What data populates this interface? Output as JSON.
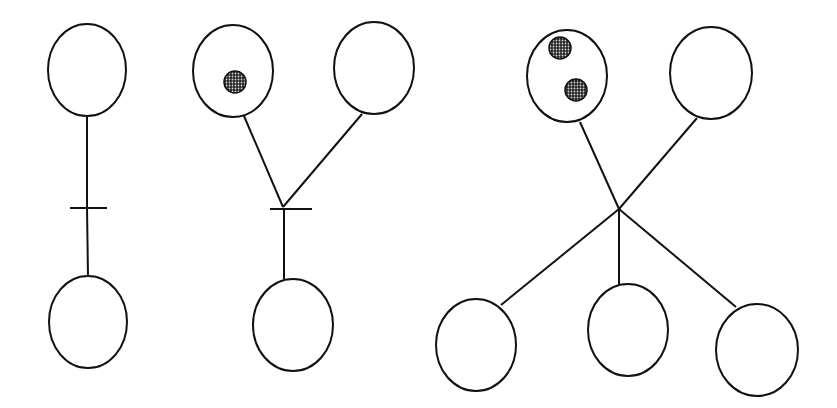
{
  "diagram": {
    "type": "petri-net",
    "colors": {
      "stroke": "#111111",
      "token": "#6e6e6e",
      "background": "#ffffff"
    },
    "nets": [
      {
        "id": "net-1",
        "places": [
          {
            "id": "p1",
            "cx": 87,
            "cy": 70,
            "rx": 39,
            "ry": 46,
            "tokens": []
          },
          {
            "id": "p2",
            "cx": 88,
            "cy": 322,
            "rx": 39,
            "ry": 46,
            "tokens": []
          }
        ],
        "transitions": [
          {
            "id": "t1",
            "x1": 70,
            "x2": 107,
            "y": 208
          }
        ],
        "arcs": [
          [
            87,
            116,
            87,
            208
          ],
          [
            87,
            208,
            88,
            276
          ]
        ]
      },
      {
        "id": "net-2",
        "places": [
          {
            "id": "p1",
            "cx": 233,
            "cy": 71,
            "rx": 40,
            "ry": 46,
            "tokens": [
              {
                "cx": 235,
                "cy": 82,
                "r": 11
              }
            ]
          },
          {
            "id": "p2",
            "cx": 374,
            "cy": 68,
            "rx": 40,
            "ry": 46,
            "tokens": []
          },
          {
            "id": "p3",
            "cx": 293,
            "cy": 325,
            "rx": 40,
            "ry": 46,
            "tokens": []
          }
        ],
        "transitions": [
          {
            "id": "t1",
            "x1": 270,
            "x2": 312,
            "y": 209
          }
        ],
        "arcs": [
          [
            244,
            116,
            283,
            207
          ],
          [
            362,
            114,
            283,
            207
          ],
          [
            284,
            209,
            284,
            279
          ]
        ]
      },
      {
        "id": "net-3",
        "places": [
          {
            "id": "p1",
            "cx": 567,
            "cy": 76,
            "rx": 40,
            "ry": 46,
            "tokens": [
              {
                "cx": 560,
                "cy": 48,
                "r": 11
              },
              {
                "cx": 576,
                "cy": 90,
                "r": 11
              }
            ]
          },
          {
            "id": "p2",
            "cx": 711,
            "cy": 73,
            "rx": 41,
            "ry": 46,
            "tokens": []
          },
          {
            "id": "p3",
            "cx": 476,
            "cy": 345,
            "rx": 40,
            "ry": 46,
            "tokens": []
          },
          {
            "id": "p4",
            "cx": 628,
            "cy": 330,
            "rx": 40,
            "ry": 46,
            "tokens": []
          },
          {
            "id": "p5",
            "cx": 757,
            "cy": 350,
            "rx": 41,
            "ry": 46,
            "tokens": []
          }
        ],
        "transitions": [],
        "arcs": [
          [
            580,
            122,
            619,
            209
          ],
          [
            697,
            118,
            619,
            209
          ],
          [
            619,
            209,
            501,
            305
          ],
          [
            619,
            209,
            619,
            285
          ],
          [
            619,
            209,
            736,
            307
          ]
        ]
      }
    ]
  }
}
